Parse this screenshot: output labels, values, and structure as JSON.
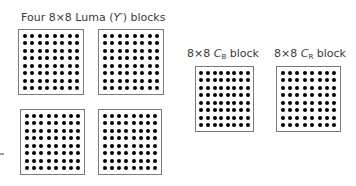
{
  "diagram": {
    "luma_label": {
      "prefix": "Four 8×8 Luma (",
      "symbol": "Y′",
      "suffix": ") blocks"
    },
    "cb_label": {
      "prefix": "8×8 ",
      "symbol": "C",
      "subscript": "B",
      "suffix": " block"
    },
    "cr_label": {
      "prefix": "8×8 ",
      "symbol": "C",
      "subscript": "R",
      "suffix": " block"
    },
    "grid_size": 8,
    "blocks": [
      {
        "id": "luma-1",
        "left": 18,
        "top": 29,
        "width": 66,
        "height": 66
      },
      {
        "id": "luma-2",
        "left": 98,
        "top": 29,
        "width": 66,
        "height": 66
      },
      {
        "id": "luma-3",
        "left": 20,
        "top": 109,
        "width": 65,
        "height": 66
      },
      {
        "id": "luma-4",
        "left": 98,
        "top": 109,
        "width": 64,
        "height": 66
      },
      {
        "id": "cb",
        "left": 195,
        "top": 66,
        "width": 59,
        "height": 66
      },
      {
        "id": "cr",
        "left": 276,
        "top": 66,
        "width": 65,
        "height": 66
      }
    ],
    "colors": {
      "border": "#7a7a7a",
      "dot": "#000000",
      "text": "#3a3a3a"
    }
  }
}
